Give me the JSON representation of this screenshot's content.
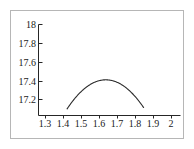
{
  "figure": {
    "background_color": "#ffffff",
    "frame_color": "#b6b6b6",
    "axis_color": "#262626",
    "curve_color": "#2b2b2b"
  },
  "chart_data": {
    "type": "line",
    "title": "",
    "subtitle": "",
    "xlabel": "",
    "ylabel": "",
    "grid": false,
    "legend": null,
    "xlim": [
      1.26,
      2.04
    ],
    "ylim": [
      17.1,
      18.03
    ],
    "xticks": [
      1.3,
      1.4,
      1.5,
      1.6,
      1.7,
      1.8,
      1.9,
      2
    ],
    "xticklabels": [
      "1.3",
      "1.4",
      "1.5",
      "1.6",
      "1.7",
      "1.8",
      "1.9",
      "2"
    ],
    "yticks": [
      17.2,
      17.4,
      17.6,
      17.8,
      18
    ],
    "yticklabels": [
      "17.2",
      "17.4",
      "17.6",
      "17.8",
      "18"
    ],
    "series": [
      {
        "name": "curve",
        "shape": "downward parabola",
        "vertex": [
          1.635,
          17.41
        ],
        "x_intercepts_at_axis_floor": [
          1.42,
          1.845
        ],
        "x": [
          1.42,
          1.45,
          1.48,
          1.51,
          1.54,
          1.57,
          1.6,
          1.635,
          1.67,
          1.7,
          1.73,
          1.76,
          1.79,
          1.82,
          1.845
        ],
        "y": [
          17.1,
          17.16,
          17.213,
          17.259,
          17.297,
          17.328,
          17.352,
          17.41,
          17.396,
          17.386,
          17.362,
          17.331,
          17.292,
          17.246,
          17.1
        ]
      }
    ]
  }
}
